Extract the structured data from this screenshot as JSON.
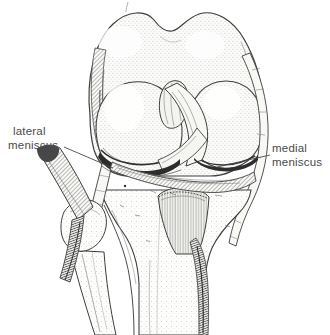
{
  "colors": {
    "background": "#ffffff",
    "ink": "#3e3e3e",
    "label_text": "#4a4a4a"
  },
  "labels": {
    "lateral_meniscus": {
      "line1": "lateral",
      "line2": "meniscus"
    },
    "medial_meniscus": {
      "line1": "medial",
      "line2": "meniscus"
    }
  }
}
